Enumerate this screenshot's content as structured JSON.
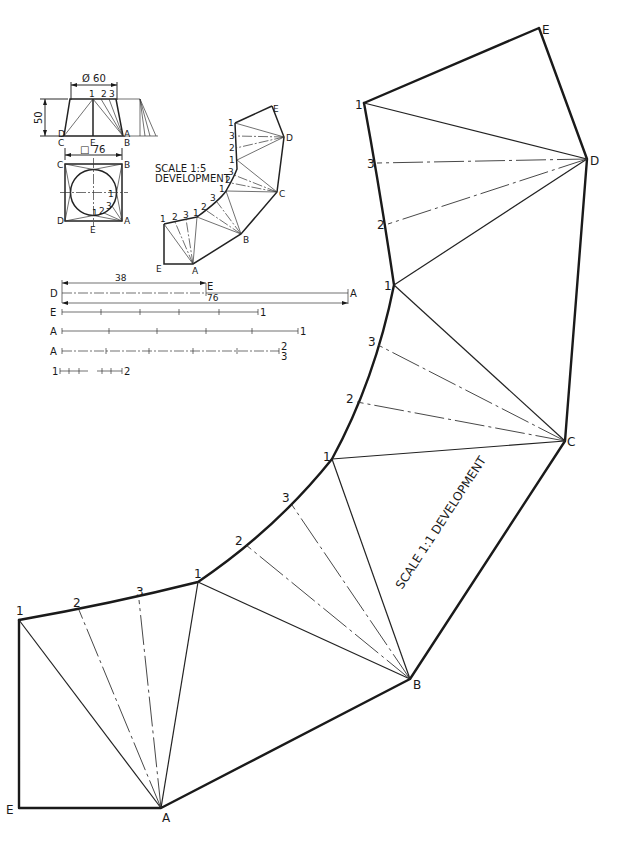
{
  "drawing": {
    "title_large": "SCALE 1:1 DEVELOPMENT",
    "title_small_line1": "SCALE 1:5",
    "title_small_line2": "DEVELOPMENT"
  },
  "elevation": {
    "diameter_label": "Ø 60",
    "height_label": "50",
    "labels": {
      "top_1": "1",
      "top_2": "2",
      "top_3": "3",
      "D": "D",
      "C": "C",
      "E": "E",
      "A": "A",
      "B": "B"
    }
  },
  "plan": {
    "square_label": "□ 76",
    "labels": {
      "C": "C",
      "B": "B",
      "D": "D",
      "A": "A",
      "E": "E",
      "p1": "1",
      "p2": "2",
      "p3": "3",
      "p1b": "1"
    }
  },
  "true_lengths": {
    "dim_38": "38",
    "dim_76": "76",
    "rows": [
      {
        "left": "D",
        "mid": "E",
        "right": "A"
      },
      {
        "left": "E",
        "right": "1"
      },
      {
        "left": "A",
        "right": "1"
      },
      {
        "left": "A",
        "right_top": "2",
        "right_bottom": "3"
      },
      {
        "left": "1",
        "right": "2"
      }
    ]
  },
  "small_development": {
    "vertices": {
      "E_bottom": "E",
      "A": "A",
      "B": "B",
      "C": "C",
      "D": "D",
      "E_top": "E"
    },
    "curve_labels": [
      "1",
      "2",
      "3",
      "1",
      "2",
      "3",
      "1",
      "2",
      "3",
      "1",
      "2",
      "3",
      "1"
    ]
  },
  "large_development": {
    "vertices": {
      "E_bottom": "E",
      "A": "A",
      "B": "B",
      "C": "C",
      "D": "D",
      "E_top": "E"
    },
    "curve_labels": [
      "1",
      "2",
      "3",
      "1",
      "2",
      "3",
      "1",
      "2",
      "3",
      "1",
      "2",
      "3",
      "1"
    ]
  }
}
